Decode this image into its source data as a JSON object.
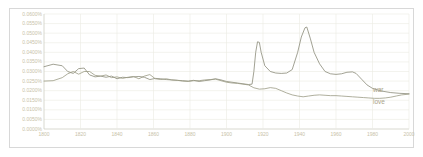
{
  "chart_data": {
    "type": "line",
    "title": "",
    "subtitle": "",
    "xlabel": "",
    "ylabel": "",
    "grid": true,
    "legend_position": "inline-right",
    "xlim": [
      1800,
      2000
    ],
    "ylim": [
      0.0,
      0.06
    ],
    "xticks": [
      "1800",
      "1820",
      "1840",
      "1860",
      "1880",
      "1900",
      "1920",
      "1940",
      "1960",
      "1980",
      "2000"
    ],
    "xtick_values": [
      1800,
      1820,
      1840,
      1860,
      1880,
      1900,
      1920,
      1940,
      1960,
      1980,
      2000
    ],
    "yticks": [
      "0.0000%",
      "0.0050%",
      "0.0100%",
      "0.0150%",
      "0.0200%",
      "0.0250%",
      "0.0300%",
      "0.0350%",
      "0.0400%",
      "0.0450%",
      "0.0500%",
      "0.0550%",
      "0.0600%"
    ],
    "ytick_values": [
      0.0,
      0.005,
      0.01,
      0.015,
      0.02,
      0.025,
      0.03,
      0.035,
      0.04,
      0.045,
      0.05,
      0.055,
      0.06
    ],
    "series": [
      {
        "name": "war",
        "color": "#8a8a78",
        "x": [
          1800,
          1805,
          1810,
          1813,
          1816,
          1819,
          1822,
          1825,
          1828,
          1831,
          1834,
          1837,
          1840,
          1843,
          1846,
          1849,
          1852,
          1855,
          1858,
          1861,
          1864,
          1867,
          1870,
          1873,
          1876,
          1879,
          1882,
          1885,
          1888,
          1891,
          1894,
          1897,
          1900,
          1903,
          1906,
          1909,
          1912,
          1914,
          1915,
          1916,
          1917,
          1918,
          1919,
          1921,
          1924,
          1927,
          1930,
          1933,
          1936,
          1939,
          1941,
          1943,
          1944,
          1946,
          1948,
          1951,
          1954,
          1957,
          1960,
          1963,
          1966,
          1969,
          1971,
          1974,
          1977,
          1980,
          1985,
          1990,
          1995,
          2000
        ],
        "values": [
          0.0325,
          0.0338,
          0.033,
          0.03,
          0.029,
          0.0315,
          0.0318,
          0.0282,
          0.0272,
          0.0276,
          0.027,
          0.0276,
          0.0262,
          0.027,
          0.0268,
          0.0272,
          0.0274,
          0.027,
          0.0258,
          0.0264,
          0.0262,
          0.0258,
          0.0256,
          0.0254,
          0.0252,
          0.025,
          0.0254,
          0.0248,
          0.0252,
          0.0256,
          0.0262,
          0.0256,
          0.0248,
          0.0244,
          0.024,
          0.0236,
          0.0232,
          0.0234,
          0.03,
          0.04,
          0.0455,
          0.0452,
          0.04,
          0.033,
          0.03,
          0.0292,
          0.029,
          0.0292,
          0.031,
          0.04,
          0.048,
          0.0528,
          0.0532,
          0.047,
          0.04,
          0.034,
          0.03,
          0.0288,
          0.0285,
          0.0288,
          0.0296,
          0.0298,
          0.029,
          0.026,
          0.023,
          0.0212,
          0.0198,
          0.019,
          0.0186,
          0.0184
        ]
      },
      {
        "name": "love",
        "color": "#9a9a84",
        "x": [
          1800,
          1805,
          1810,
          1813,
          1816,
          1819,
          1822,
          1825,
          1828,
          1831,
          1834,
          1837,
          1840,
          1843,
          1846,
          1849,
          1852,
          1855,
          1858,
          1861,
          1864,
          1867,
          1870,
          1873,
          1876,
          1879,
          1882,
          1885,
          1888,
          1891,
          1894,
          1897,
          1900,
          1903,
          1906,
          1909,
          1912,
          1915,
          1918,
          1921,
          1924,
          1927,
          1930,
          1933,
          1936,
          1939,
          1942,
          1945,
          1948,
          1951,
          1954,
          1957,
          1960,
          1963,
          1966,
          1969,
          1972,
          1975,
          1978,
          1981,
          1984,
          1987,
          1990,
          1993,
          1996,
          2000
        ],
        "values": [
          0.025,
          0.0252,
          0.0268,
          0.0288,
          0.03,
          0.0286,
          0.03,
          0.03,
          0.028,
          0.0276,
          0.0282,
          0.0268,
          0.0272,
          0.0264,
          0.027,
          0.0274,
          0.0262,
          0.0276,
          0.0284,
          0.0262,
          0.0258,
          0.0262,
          0.0256,
          0.0254,
          0.025,
          0.0248,
          0.0252,
          0.0252,
          0.0256,
          0.0258,
          0.026,
          0.0252,
          0.0244,
          0.024,
          0.0238,
          0.0234,
          0.023,
          0.0215,
          0.0208,
          0.021,
          0.0216,
          0.0212,
          0.02,
          0.0188,
          0.0178,
          0.0172,
          0.0168,
          0.0172,
          0.0176,
          0.0178,
          0.0176,
          0.0174,
          0.0174,
          0.0172,
          0.017,
          0.0168,
          0.0166,
          0.0164,
          0.0162,
          0.016,
          0.016,
          0.0162,
          0.0166,
          0.0172,
          0.0178,
          0.0182
        ]
      }
    ],
    "annotations": [
      {
        "text": "war",
        "x": 2000,
        "y": 0.0205
      },
      {
        "text": "love",
        "x": 2000,
        "y": 0.014
      }
    ]
  },
  "colors": {
    "grid": "#ebebe3",
    "axis": "#cfcfc4",
    "tick_text": "#c8c2a8",
    "series_label": "#a9a289",
    "frame": "#d8d8d8",
    "background": "#ffffff"
  }
}
